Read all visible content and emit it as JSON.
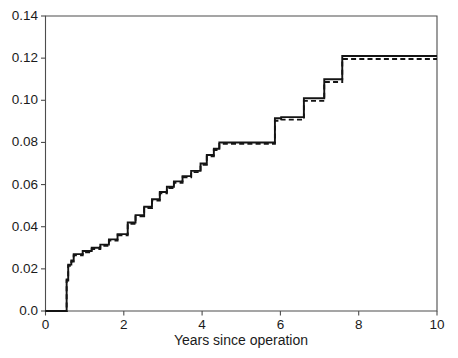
{
  "chart_data": {
    "type": "line",
    "subtype": "step-cumulative-incidence",
    "title": "",
    "subtitle": "",
    "xlabel": "Years since operation",
    "ylabel": "",
    "xlim": [
      0,
      10
    ],
    "ylim": [
      0.0,
      0.14
    ],
    "grid": false,
    "legend_position": "none",
    "xticks": [
      0,
      2,
      4,
      6,
      8,
      10
    ],
    "xtick_labels": [
      "0",
      "2",
      "4",
      "6",
      "8",
      "10"
    ],
    "yticks": [
      0.0,
      0.02,
      0.04,
      0.06,
      0.08,
      0.1,
      0.12,
      0.14
    ],
    "ytick_labels": [
      "0.0",
      "0.02",
      "0.04",
      "0.06",
      "0.08",
      "0.10",
      "0.12",
      "0.14"
    ],
    "series": [
      {
        "name": "solid-curve",
        "style": "solid",
        "color": "#141414",
        "x": [
          0.0,
          0.54,
          0.54,
          0.58,
          0.58,
          0.66,
          0.66,
          0.72,
          0.72,
          0.95,
          0.95,
          1.18,
          1.18,
          1.4,
          1.4,
          1.62,
          1.62,
          1.84,
          1.84,
          2.1,
          2.1,
          2.3,
          2.3,
          2.52,
          2.52,
          2.72,
          2.72,
          2.92,
          2.92,
          3.1,
          3.1,
          3.28,
          3.28,
          3.5,
          3.5,
          3.72,
          3.72,
          3.96,
          3.96,
          4.12,
          4.12,
          4.3,
          4.3,
          4.44,
          4.44,
          5.86,
          5.86,
          6.02,
          6.02,
          6.6,
          6.6,
          7.12,
          7.12,
          7.58,
          7.58,
          10.0
        ],
        "y": [
          0.0,
          0.0,
          0.015,
          0.015,
          0.022,
          0.022,
          0.024,
          0.024,
          0.027,
          0.027,
          0.0285,
          0.0285,
          0.03,
          0.03,
          0.0315,
          0.0315,
          0.034,
          0.034,
          0.0365,
          0.0365,
          0.042,
          0.042,
          0.0455,
          0.0455,
          0.0495,
          0.0495,
          0.053,
          0.053,
          0.0565,
          0.0565,
          0.059,
          0.059,
          0.0615,
          0.0615,
          0.064,
          0.064,
          0.0665,
          0.0665,
          0.07,
          0.07,
          0.074,
          0.074,
          0.077,
          0.077,
          0.08,
          0.08,
          0.0915,
          0.0915,
          0.092,
          0.092,
          0.101,
          0.101,
          0.11,
          0.11,
          0.121,
          0.121
        ]
      },
      {
        "name": "dashed-curve",
        "style": "dashed",
        "color": "#141414",
        "x": [
          0.0,
          0.54,
          0.54,
          0.58,
          0.58,
          0.66,
          0.66,
          0.72,
          0.72,
          0.95,
          0.95,
          1.18,
          1.18,
          1.4,
          1.4,
          1.62,
          1.62,
          1.84,
          1.84,
          2.1,
          2.1,
          2.3,
          2.3,
          2.52,
          2.52,
          2.72,
          2.72,
          2.92,
          2.92,
          3.1,
          3.1,
          3.28,
          3.28,
          3.5,
          3.5,
          3.72,
          3.72,
          3.96,
          3.96,
          4.12,
          4.12,
          4.3,
          4.3,
          4.44,
          4.44,
          5.86,
          5.86,
          6.02,
          6.02,
          6.6,
          6.6,
          7.12,
          7.12,
          7.58,
          7.58,
          10.0
        ],
        "y": [
          0.0,
          0.0,
          0.0145,
          0.0145,
          0.0215,
          0.0215,
          0.0235,
          0.0235,
          0.0264,
          0.0264,
          0.0279,
          0.0279,
          0.0294,
          0.0294,
          0.0309,
          0.0309,
          0.0334,
          0.0334,
          0.0359,
          0.0359,
          0.0414,
          0.0414,
          0.0449,
          0.0449,
          0.0489,
          0.0489,
          0.0524,
          0.0524,
          0.0559,
          0.0559,
          0.0584,
          0.0584,
          0.0609,
          0.0609,
          0.0634,
          0.0634,
          0.0659,
          0.0659,
          0.0694,
          0.0694,
          0.0734,
          0.0734,
          0.0764,
          0.0764,
          0.0793,
          0.0793,
          0.0903,
          0.0903,
          0.0908,
          0.0908,
          0.0997,
          0.0997,
          0.1087,
          0.1087,
          0.1196,
          0.1196
        ]
      }
    ]
  }
}
